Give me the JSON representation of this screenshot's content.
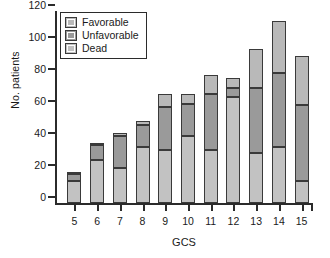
{
  "chart_data": {
    "type": "bar",
    "stacked": true,
    "title": "",
    "xlabel": "GCS",
    "ylabel": "No. patients",
    "categories": [
      "5",
      "6",
      "7",
      "8",
      "9",
      "10",
      "11",
      "12",
      "13",
      "14",
      "15"
    ],
    "ylim": [
      0,
      120
    ],
    "yticks": [
      0,
      20,
      40,
      60,
      80,
      100,
      120
    ],
    "grid": false,
    "legend_position": "upper-left-inside",
    "series": [
      {
        "name": "Dead",
        "color": "#c2c2c2",
        "values": [
          14,
          27,
          22,
          35,
          33,
          42,
          33,
          66,
          31,
          35,
          14
        ]
      },
      {
        "name": "Unfavorable",
        "color": "#9a9a9a",
        "values": [
          4,
          9,
          20,
          14,
          27,
          20,
          35,
          6,
          41,
          46,
          47
        ]
      },
      {
        "name": "Favorable",
        "color": "#b9b9b9",
        "values": [
          1,
          1,
          2,
          2,
          8,
          6,
          12,
          6,
          24,
          33,
          31
        ]
      }
    ],
    "totals": [
      19,
      37,
      44,
      51,
      68,
      68,
      80,
      78,
      96,
      114,
      92
    ],
    "stack_order_bottom_to_top": [
      "Dead",
      "Unfavorable",
      "Favorable"
    ]
  },
  "legend": {
    "items": [
      {
        "label": "Favorable",
        "icon": "color-swatch-icon"
      },
      {
        "label": "Unfavorable",
        "icon": "color-swatch-icon"
      },
      {
        "label": "Dead",
        "icon": "color-swatch-icon"
      }
    ]
  }
}
